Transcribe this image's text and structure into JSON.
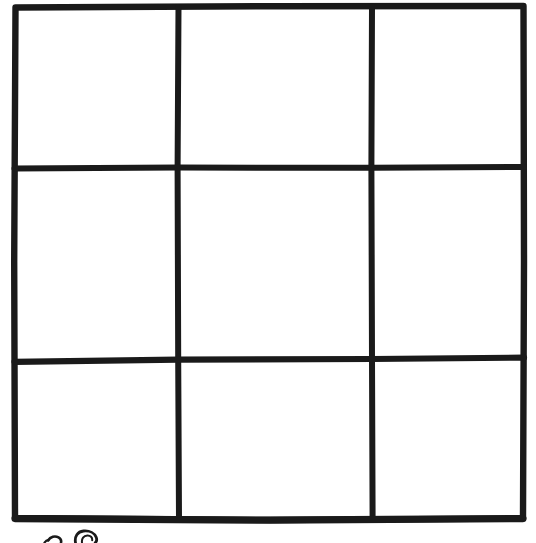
{
  "page": {
    "background_color": "#ffffff",
    "width": 536,
    "height": 543
  },
  "figure": {
    "name": "3x3 grid",
    "ink_color": "#1a1a1a",
    "paper_color": "#ffffff",
    "rows": 3,
    "columns": 3,
    "cell_count": 9,
    "stroke_width_px": 6,
    "bounds": {
      "left": 13,
      "top": 6,
      "right": 524,
      "bottom": 520
    },
    "vertical_dividers_x": [
      178,
      372
    ],
    "horizontal_dividers_y": [
      168,
      360
    ]
  },
  "cells": [
    {
      "id": "r1c1",
      "row": 1,
      "column": 1,
      "label": "cell-row1-col1",
      "content": ""
    },
    {
      "id": "r1c2",
      "row": 1,
      "column": 2,
      "label": "cell-row1-col2",
      "content": ""
    },
    {
      "id": "r1c3",
      "row": 1,
      "column": 3,
      "label": "cell-row1-col3",
      "content": ""
    },
    {
      "id": "r2c1",
      "row": 2,
      "column": 1,
      "label": "cell-row2-col1",
      "content": ""
    },
    {
      "id": "r2c2",
      "row": 2,
      "column": 2,
      "label": "cell-row2-col2",
      "content": ""
    },
    {
      "id": "r2c3",
      "row": 2,
      "column": 3,
      "label": "cell-row2-col3",
      "content": ""
    },
    {
      "id": "r3c1",
      "row": 3,
      "column": 1,
      "label": "cell-row3-col1",
      "content": ""
    },
    {
      "id": "r3c2",
      "row": 3,
      "column": 2,
      "label": "cell-row3-col2",
      "content": ""
    },
    {
      "id": "r3c3",
      "row": 3,
      "column": 3,
      "label": "cell-row3-col3",
      "content": ""
    }
  ],
  "margin_note": {
    "name": "handwriting-fragment",
    "description": "Tops of two handwritten characters, cut off by the bottom edge of the page",
    "text": "",
    "ink_color": "#1a1a1a"
  }
}
